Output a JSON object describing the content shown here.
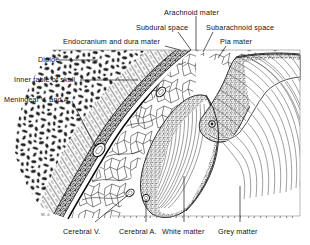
{
  "figure": {
    "signature": "M. d.",
    "ink_color": "#1a1a1a",
    "paper_color": "#ffffff"
  },
  "labels": {
    "arachnoid_mater": "Arachnoid mater",
    "subdural_space": "Subdural space",
    "subarachnoid_space": "Subarachnoid space",
    "endocranium_dura": "Endocranium and dura mater",
    "pia_mater": "Pia mater",
    "diploe": "Diploë",
    "inner_table": "Inner table of skull",
    "meningeal_va": "Meningeal V. and A.",
    "cerebral_v": "Cerebral V.",
    "cerebral_a": "Cerebral A.",
    "white_matter": "White matter",
    "grey_matter": "Grey matter"
  },
  "structures": [
    {
      "name": "diploe",
      "texture": "irregular-dark-blotches",
      "region": "upper-left"
    },
    {
      "name": "inner-table-of-skull",
      "texture": "fine-hatching",
      "region": "left-band"
    },
    {
      "name": "endocranium-and-dura-mater",
      "texture": "dense-stipple-band",
      "region": "diagonal-band"
    },
    {
      "name": "subdural-space",
      "texture": "thin-clear-line",
      "region": "beneath-dura"
    },
    {
      "name": "arachnoid-mater",
      "texture": "solid-line",
      "region": "beneath-subdural"
    },
    {
      "name": "subarachnoid-space",
      "texture": "polygonal-trabecular-web",
      "region": "mid"
    },
    {
      "name": "pia-mater",
      "texture": "thin-line-on-cortex",
      "region": "cortex-surface"
    },
    {
      "name": "grey-matter",
      "texture": "coarse-stipple",
      "region": "cortical-ribbon"
    },
    {
      "name": "white-matter",
      "texture": "parallel-line-hatching",
      "region": "core"
    },
    {
      "name": "meningeal-vessels",
      "texture": "oval-lumens",
      "region": "left"
    },
    {
      "name": "cerebral-vein",
      "texture": "oval-lumen",
      "region": "lower-left"
    },
    {
      "name": "cerebral-artery",
      "texture": "oval-lumen",
      "region": "lower-mid"
    }
  ]
}
